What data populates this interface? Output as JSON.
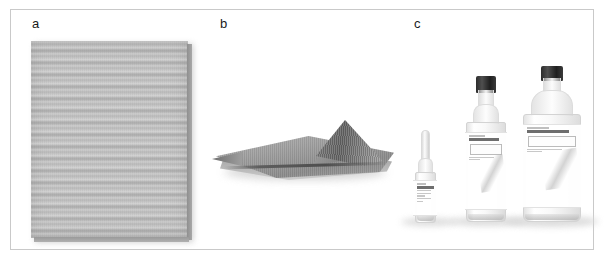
{
  "figure": {
    "panels": [
      {
        "id": "a",
        "label": "a",
        "subject": "gauze-pad",
        "description": "Rectangular grey gauze / non-woven pad with horizontal weave texture"
      },
      {
        "id": "b",
        "label": "b",
        "subject": "folded-mesh-cloth",
        "description": "Flat grey mesh cloth laid out with a raised pinched peak on the right side"
      },
      {
        "id": "c",
        "label": "c",
        "subject": "solution-bottles",
        "description": "Three clear plastic bottles of solution in increasing size: small dropper bottle, medium spray bottle with black cap, large bottle with black cap"
      }
    ]
  },
  "panel_c": {
    "bottles": [
      {
        "name": "small-dropper-bottle",
        "cap": "white-dropper-cap",
        "size_order": 1
      },
      {
        "name": "medium-spray-bottle",
        "cap": "black-cap",
        "size_order": 2
      },
      {
        "name": "large-bottle",
        "cap": "black-cap",
        "size_order": 3
      }
    ]
  },
  "colors": {
    "background": "#ffffff",
    "frame_border": "#c9c9c9",
    "label_text": "#1a1a1a",
    "gauze_grey": "#bdbdbd",
    "cloth_grey": "#8c8c8c",
    "cap_black": "#2c2c2c"
  }
}
